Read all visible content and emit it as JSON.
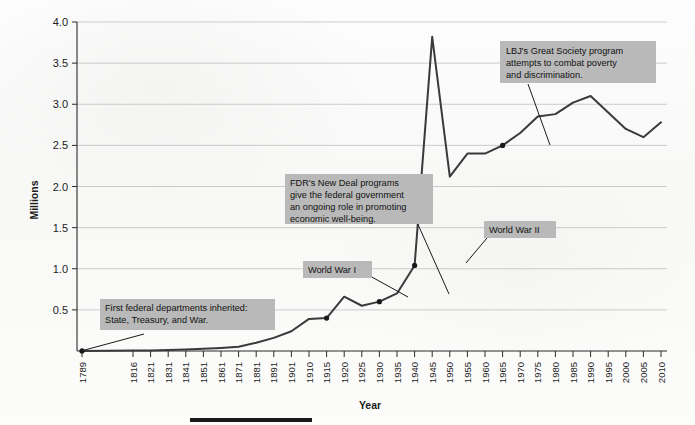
{
  "chart_data": {
    "type": "line",
    "title": "",
    "xlabel": "Year",
    "ylabel": "Millions",
    "ylim": [
      0,
      4.0
    ],
    "ytick_labels": [
      "4.0",
      "3.5",
      "3.0",
      "2.5",
      "2.0",
      "1.5",
      "1.0",
      "0.5"
    ],
    "ytick_values": [
      4.0,
      3.5,
      3.0,
      2.5,
      2.0,
      1.5,
      1.0,
      0.5
    ],
    "grid": "horizontal",
    "legend": "none",
    "xtick_labels": [
      "1789",
      "1816",
      "1821",
      "1831",
      "1841",
      "1851",
      "1861",
      "1871",
      "1881",
      "1891",
      "1901",
      "1910",
      "1915",
      "1920",
      "1925",
      "1930",
      "1935",
      "1940",
      "1945",
      "1950",
      "1955",
      "1960",
      "1965",
      "1970",
      "1975",
      "1980",
      "1985",
      "1990",
      "1995",
      "2000",
      "2005",
      "2010"
    ],
    "series": [
      {
        "name": "Federal civilian employment",
        "x": [
          1789,
          1816,
          1821,
          1831,
          1841,
          1851,
          1861,
          1871,
          1881,
          1891,
          1901,
          1910,
          1915,
          1920,
          1925,
          1930,
          1935,
          1940,
          1945,
          1950,
          1955,
          1960,
          1965,
          1970,
          1975,
          1980,
          1985,
          1990,
          1995,
          2000,
          2005,
          2010
        ],
        "values": [
          0.001,
          0.005,
          0.007,
          0.011,
          0.018,
          0.026,
          0.037,
          0.051,
          0.1,
          0.16,
          0.24,
          0.39,
          0.4,
          0.66,
          0.55,
          0.6,
          0.7,
          1.04,
          3.82,
          2.12,
          2.4,
          2.4,
          2.5,
          2.65,
          2.85,
          2.88,
          3.02,
          3.1,
          2.9,
          2.7,
          2.6,
          2.78
        ]
      }
    ],
    "markers": [
      {
        "year": 1789,
        "value": 0.001
      },
      {
        "year": 1915,
        "value": 0.4
      },
      {
        "year": 1930,
        "value": 0.6
      },
      {
        "year": 1940,
        "value": 1.04
      },
      {
        "year": 1965,
        "value": 2.5
      }
    ],
    "annotations": [
      {
        "id": "first-federal-departments",
        "lines": [
          "First federal departments inherited:",
          "State, Treasury, and War."
        ],
        "target_year": 1789,
        "target_value": 0.001
      },
      {
        "id": "fdr-new-deal",
        "lines": [
          "FDR's New Deal programs",
          "give the federal government",
          "an ongoing role in promoting",
          "economic well-being."
        ],
        "target_year": 1930,
        "target_value": 0.6
      },
      {
        "id": "world-war-one",
        "lines": [
          "World War I"
        ],
        "target_year": 1915,
        "target_value": 0.4
      },
      {
        "id": "world-war-two",
        "lines": [
          "World War II"
        ],
        "target_year": 1940,
        "target_value": 1.04
      },
      {
        "id": "lbj-great-society",
        "lines": [
          "LBJ's Great Society program",
          "attempts to combat poverty",
          "and discrimination."
        ],
        "target_year": 1965,
        "target_value": 2.5
      }
    ],
    "colors": {
      "line": "#3a3a3a",
      "grid": "#bfbfbf",
      "axis": "#2a2a2a",
      "annotation_box": "#b9b9b9",
      "annotation_text": "#111111",
      "background": "#fbfbfb"
    }
  },
  "axis": {
    "y_title": "Millions",
    "x_title": "Year"
  },
  "ytick_labels": {
    "t0": "4.0",
    "t1": "3.5",
    "t2": "3.0",
    "t3": "2.5",
    "t4": "2.0",
    "t5": "1.5",
    "t6": "1.0",
    "t7": "0.5"
  },
  "annotation_text": {
    "a1_l1": "First federal departments inherited:",
    "a1_l2": "State, Treasury, and War.",
    "a2_l1": "FDR's New Deal programs",
    "a2_l2": "give the federal government",
    "a2_l3": "an ongoing role in promoting",
    "a2_l4": "economic well-being.",
    "a3_l1": "World War I",
    "a4_l1": "World War II",
    "a5_l1": "LBJ's Great Society program",
    "a5_l2": "attempts to combat poverty",
    "a5_l3": "and discrimination."
  }
}
